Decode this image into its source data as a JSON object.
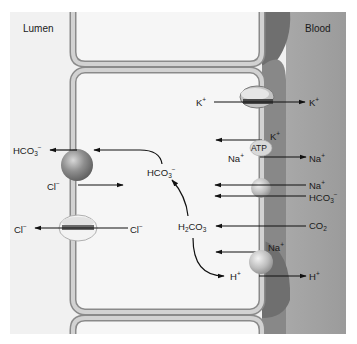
{
  "regions": {
    "lumen": "Lumen",
    "blood": "Blood"
  },
  "colors": {
    "lumen_bg": "#f1f1f1",
    "blood_bg": "#9a9a9a",
    "interstitial": "#7d7d7d",
    "membrane": "#c9c9c9",
    "membrane_edge": "#8a8a8a",
    "cell_interior": "#f6f6f6",
    "arrow": "#111111"
  },
  "labels": {
    "k_in": {
      "base": "K",
      "sup": "+"
    },
    "k_out": {
      "base": "K",
      "sup": "+"
    },
    "k_pump": {
      "base": "K",
      "sup": "+"
    },
    "atp": "ATP",
    "na_pump_in": {
      "base": "Na",
      "sup": "+"
    },
    "na_pump_out": {
      "base": "Na",
      "sup": "+"
    },
    "na_cotransport": {
      "base": "Na",
      "sup": "+"
    },
    "hco3_cotransport": {
      "base": "HCO",
      "sub": "3",
      "sup": "−"
    },
    "co2": {
      "base": "CO",
      "sub": "2"
    },
    "na_exchange": {
      "base": "Na",
      "sup": "+"
    },
    "h_in": {
      "base": "H",
      "sup": "+"
    },
    "h_out": {
      "base": "H",
      "sup": "+"
    },
    "h2co3": {
      "pre": "H",
      "sub1": "2",
      "base": "CO",
      "sub2": "3"
    },
    "hco3_cell": {
      "base": "HCO",
      "sub": "3",
      "sup": "−"
    },
    "hco3_lumen": {
      "base": "HCO",
      "sub": "3",
      "sup": "−"
    },
    "cl_exchanger": {
      "base": "Cl",
      "sup": "−"
    },
    "cl_channel_lumen": {
      "base": "Cl",
      "sup": "−"
    },
    "cl_channel_cell": {
      "base": "Cl",
      "sup": "−"
    }
  }
}
